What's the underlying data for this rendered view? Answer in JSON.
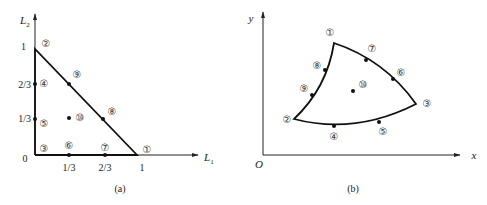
{
  "panel_a": {
    "caption": "(a)",
    "x_axis_label": "L",
    "x_axis_sub": "1",
    "y_axis_label": "L",
    "y_axis_sub": "2",
    "x_ticks": [
      "1/3",
      "2/3",
      "1"
    ],
    "y_ticks": [
      "1",
      "2/3",
      "1/3"
    ],
    "origin_label": "0",
    "nodes": [
      {
        "id": "①",
        "L1": 1,
        "L2": 0
      },
      {
        "id": "②",
        "L1": 0,
        "L2": 1
      },
      {
        "id": "③",
        "L1": 0,
        "L2": 0
      },
      {
        "id": "④",
        "L1": 0,
        "L2": 0.6667
      },
      {
        "id": "⑤",
        "L1": 0,
        "L2": 0.3333
      },
      {
        "id": "⑥",
        "L1": 0.3333,
        "L2": 0
      },
      {
        "id": "⑦",
        "L1": 0.6667,
        "L2": 0
      },
      {
        "id": "⑧",
        "L1": 0.6667,
        "L2": 0.3333
      },
      {
        "id": "⑨",
        "L1": 0.3333,
        "L2": 0.6667
      },
      {
        "id": "⑩",
        "L1": 0.3333,
        "L2": 0.3333
      }
    ]
  },
  "panel_b": {
    "caption": "(b)",
    "x_axis_label": "x",
    "y_axis_label": "y",
    "origin_label": "O",
    "nodes": [
      "①",
      "②",
      "③",
      "④",
      "⑤",
      "⑥",
      "⑦",
      "⑧",
      "⑨",
      "⑩"
    ]
  }
}
